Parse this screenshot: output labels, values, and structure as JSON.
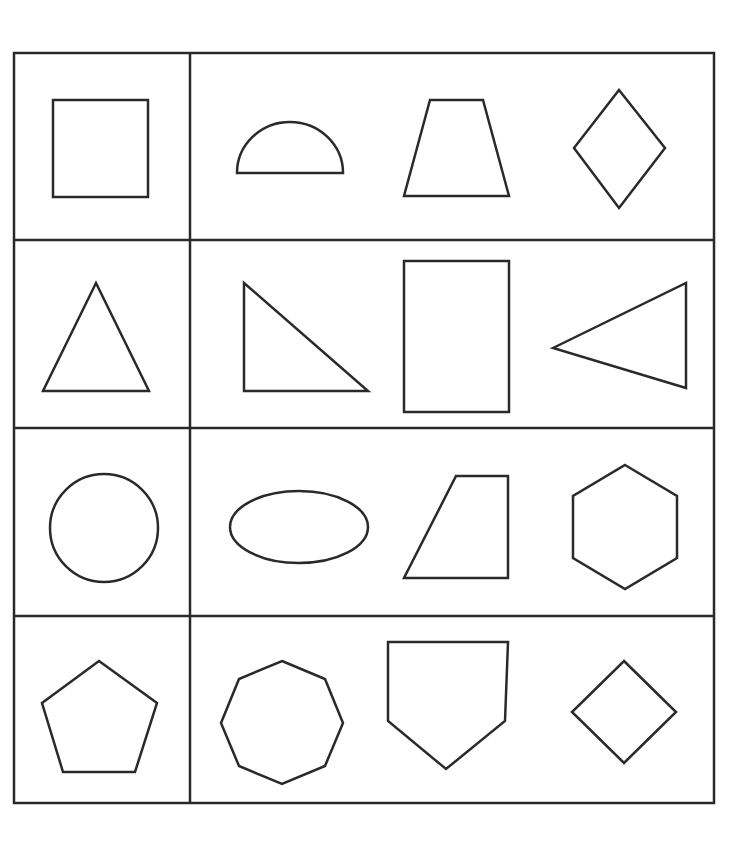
{
  "worksheet": {
    "title": "Shape matching grid",
    "stroke_color": "#2a2a2a",
    "background_color": "#ffffff",
    "grid": {
      "rows": 4,
      "left_column_label": "Target shape",
      "right_column_label": "Choices"
    },
    "rows": [
      {
        "target": "square",
        "choices": [
          "semicircle",
          "trapezoid",
          "rhombus"
        ]
      },
      {
        "target": "equilateral triangle",
        "choices": [
          "right triangle",
          "rectangle",
          "isosceles triangle (pointing left)"
        ]
      },
      {
        "target": "circle",
        "choices": [
          "ellipse",
          "right trapezoid",
          "hexagon"
        ]
      },
      {
        "target": "pentagon",
        "choices": [
          "octagon",
          "home-plate pentagon",
          "square diamond"
        ]
      }
    ]
  }
}
